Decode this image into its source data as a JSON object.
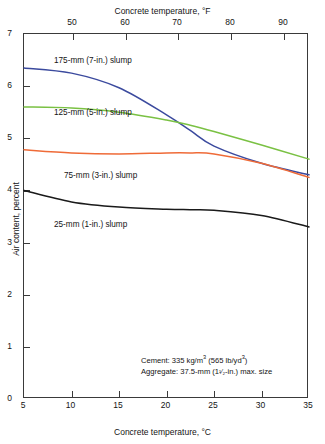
{
  "chart_data": {
    "type": "line",
    "title": "",
    "xlabel": "Concrete temperature, °C",
    "xlabel_top": "Concrete temperature, °F",
    "ylabel": "Air content, percent",
    "xlim": [
      5,
      35
    ],
    "ylim": [
      0,
      7
    ],
    "xticks": [
      "5",
      "10",
      "15",
      "20",
      "25",
      "30",
      "35"
    ],
    "xtick_values": [
      5,
      10,
      15,
      20,
      25,
      30,
      35
    ],
    "xticks_top": [
      "50",
      "60",
      "70",
      "80",
      "90"
    ],
    "xtick_top_values": [
      50,
      60,
      70,
      80,
      90
    ],
    "yticks": [
      "0",
      "1",
      "2",
      "3",
      "4",
      "5",
      "6",
      "7"
    ],
    "ytick_values": [
      0,
      1,
      2,
      3,
      4,
      5,
      6,
      7
    ],
    "grid": false,
    "legend_position": "inline-labels",
    "x": [
      5,
      10,
      15,
      20,
      22.5,
      25,
      30,
      35
    ],
    "series": [
      {
        "name": "175-mm (7-in.) slump",
        "label": "175-mm (7-in.) slump",
        "color": "#3b4a9e",
        "values": [
          6.35,
          6.25,
          5.97,
          5.45,
          5.15,
          4.85,
          4.52,
          4.3
        ]
      },
      {
        "name": "125-mm (5-in.) slump",
        "label": "125-mm (5-in.) slump",
        "color": "#7ac143",
        "values": [
          5.6,
          5.58,
          5.5,
          5.35,
          5.25,
          5.13,
          4.87,
          4.6
        ]
      },
      {
        "name": "75-mm (3-in.) slump",
        "label": "75-mm (3-in.) slump",
        "color": "#ef6b38",
        "values": [
          4.78,
          4.72,
          4.7,
          4.72,
          4.72,
          4.7,
          4.52,
          4.25
        ]
      },
      {
        "name": "25-mm (1-in.) slump",
        "label": "25-mm (1-in.) slump",
        "color": "#1a1a1a",
        "values": [
          4.0,
          3.78,
          3.68,
          3.64,
          3.63,
          3.62,
          3.52,
          3.3
        ]
      }
    ],
    "annotations": {
      "cement_prefix": "Cement: 335 kg/m",
      "cement_sup1": "3",
      "cement_mid": " (565 lb/yd",
      "cement_sup2": "3",
      "cement_suffix": ")",
      "aggregate_prefix": "Aggregate: 37.5-mm (1",
      "aggregate_frac": "¹⁄₂",
      "aggregate_suffix": "-in.) max. size",
      "cement_full": "Cement: 335 kg/m3 (565 lb/yd3)",
      "aggregate_full": "Aggregate: 37.5-mm (1 1/2-in.) max. size"
    }
  }
}
